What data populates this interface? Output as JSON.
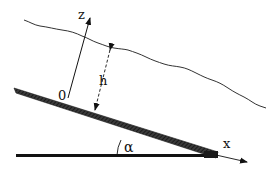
{
  "diagram": {
    "type": "physics-schematic",
    "labels": {
      "z_axis": "z",
      "x_axis": "x",
      "origin": "0",
      "thickness": "h",
      "angle": "α"
    },
    "colors": {
      "stroke": "#111111",
      "free_surface": "#333333",
      "plate_fill": "#2a2a2a",
      "background": "#ffffff"
    },
    "elements": {
      "free_surface": "wavy line representing the liquid film surface",
      "inclined_plate": "thick hatched band representing the inclined wall",
      "horizontal_base": "horizontal reference line",
      "z_axis_arrow": "axis normal to the plate",
      "x_axis_arrow": "axis along the plate",
      "thickness_arrow": "dashed double arrow indicating film thickness h",
      "angle_arc": "arc indicating inclination angle alpha"
    }
  }
}
